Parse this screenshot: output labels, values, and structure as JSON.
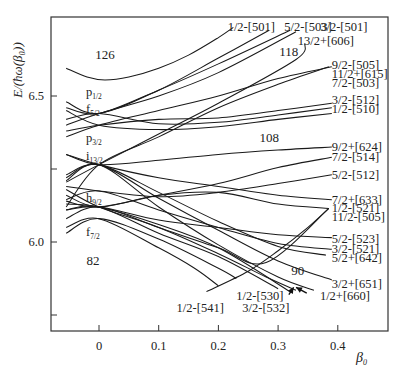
{
  "chart_data": {
    "type": "line",
    "title": "",
    "xlabel": "β₀",
    "ylabel": "E/(ħω(β₀))",
    "xlim": [
      -0.08,
      0.485
    ],
    "ylim": [
      5.7,
      6.775
    ],
    "x_ticks": [
      {
        "value": 0,
        "label": "0"
      },
      {
        "value": 0.1,
        "label": "0.1"
      },
      {
        "value": 0.2,
        "label": "0.2"
      },
      {
        "value": 0.3,
        "label": "0.3"
      },
      {
        "value": 0.4,
        "label": "0.4"
      }
    ],
    "y_ticks": [
      {
        "value": 5.75,
        "label": ""
      },
      {
        "value": 6.0,
        "label": "6.0"
      },
      {
        "value": 6.25,
        "label": ""
      },
      {
        "value": 6.5,
        "label": "6.5"
      }
    ],
    "grid": false,
    "legend": null,
    "spherical_orbitals": [
      {
        "name": "p",
        "sub": "1/2",
        "label_x": -0.015,
        "label_y": 6.515
      },
      {
        "name": "f",
        "sub": "5/2",
        "label_x": -0.015,
        "label_y": 6.455
      },
      {
        "name": "p",
        "sub": "3/2",
        "label_x": -0.015,
        "label_y": 6.355
      },
      {
        "name": "i",
        "sub": "13/2",
        "label_x": -0.015,
        "label_y": 6.295
      },
      {
        "name": "h",
        "sub": "9/2",
        "label_x": -0.015,
        "label_y": 6.15
      },
      {
        "name": "f",
        "sub": "7/2",
        "label_x": -0.015,
        "label_y": 6.035
      }
    ],
    "magic_numbers": [
      {
        "label": "126",
        "x": 0.01,
        "y": 6.645
      },
      {
        "label": "118",
        "x": 0.318,
        "y": 6.655
      },
      {
        "label": "108",
        "x": 0.285,
        "y": 6.36
      },
      {
        "label": "90",
        "x": 0.333,
        "y": 5.905
      },
      {
        "label": "82",
        "x": -0.01,
        "y": 5.94
      }
    ],
    "series": [
      {
        "name": "126-gap curve",
        "points": [
          [
            -0.055,
            6.595
          ],
          [
            -0.02,
            6.565
          ],
          [
            0.01,
            6.555
          ],
          [
            0.05,
            6.565
          ],
          [
            0.1,
            6.595
          ],
          [
            0.15,
            6.64
          ],
          [
            0.2,
            6.7
          ],
          [
            0.225,
            6.735
          ]
        ]
      },
      {
        "name": "1/2-[501]",
        "label_at": [
          0.255,
          6.735
        ],
        "label_anchor": "middle",
        "points": [
          [
            -0.055,
            6.48
          ],
          [
            0.0,
            6.44
          ],
          [
            0.1,
            6.52
          ],
          [
            0.2,
            6.63
          ],
          [
            0.285,
            6.725
          ]
        ]
      },
      {
        "name": "5/2-[503]",
        "label_at": [
          0.35,
          6.735
        ],
        "label_anchor": "middle",
        "points": [
          [
            -0.055,
            6.46
          ],
          [
            0.0,
            6.44
          ],
          [
            0.1,
            6.52
          ],
          [
            0.2,
            6.61
          ],
          [
            0.32,
            6.725
          ]
        ]
      },
      {
        "name": "3/2-[501]",
        "label_at": [
          0.41,
          6.735
        ],
        "label_anchor": "middle",
        "points": [
          [
            -0.055,
            6.4
          ],
          [
            0.0,
            6.44
          ],
          [
            0.1,
            6.5
          ],
          [
            0.2,
            6.58
          ],
          [
            0.33,
            6.72
          ]
        ]
      },
      {
        "name": "13/2+[606]",
        "label_at": [
          0.38,
          6.69
        ],
        "label_anchor": "middle",
        "points": [
          [
            -0.055,
            6.205
          ],
          [
            0.0,
            6.265
          ],
          [
            0.1,
            6.37
          ],
          [
            0.2,
            6.475
          ],
          [
            0.33,
            6.625
          ],
          [
            0.345,
            6.68
          ]
        ]
      },
      {
        "name": "9/2-[505]",
        "label_at": [
          0.39,
          6.605
        ],
        "label_anchor": "start",
        "points": [
          [
            -0.055,
            6.45
          ],
          [
            0.0,
            6.4
          ],
          [
            0.1,
            6.385
          ],
          [
            0.2,
            6.395
          ],
          [
            0.3,
            6.42
          ],
          [
            0.39,
            6.44
          ]
        ]
      },
      {
        "name": "11/2+[615]",
        "label_at": [
          0.39,
          6.575
        ],
        "label_anchor": "start",
        "points": [
          [
            -0.055,
            6.12
          ],
          [
            0.0,
            6.265
          ],
          [
            0.1,
            6.36
          ],
          [
            0.2,
            6.46
          ],
          [
            0.3,
            6.54
          ],
          [
            0.385,
            6.6
          ]
        ]
      },
      {
        "name": "7/2-[503]",
        "label_at": [
          0.39,
          6.545
        ],
        "label_anchor": "start",
        "points": [
          [
            -0.055,
            6.36
          ],
          [
            0.0,
            6.4
          ],
          [
            0.1,
            6.45
          ],
          [
            0.2,
            6.5
          ],
          [
            0.3,
            6.56
          ],
          [
            0.39,
            6.6
          ]
        ]
      },
      {
        "name": "3/2-[512]",
        "label_at": [
          0.39,
          6.488
        ],
        "label_anchor": "start",
        "points": [
          [
            -0.055,
            6.38
          ],
          [
            0.0,
            6.4
          ],
          [
            0.1,
            6.42
          ],
          [
            0.2,
            6.425
          ],
          [
            0.3,
            6.45
          ],
          [
            0.39,
            6.475
          ]
        ]
      },
      {
        "name": "1/2-[510]",
        "label_at": [
          0.39,
          6.455
        ],
        "label_anchor": "start",
        "points": [
          [
            -0.055,
            6.42
          ],
          [
            0.0,
            6.44
          ],
          [
            0.1,
            6.405
          ],
          [
            0.2,
            6.41
          ],
          [
            0.3,
            6.435
          ],
          [
            0.39,
            6.46
          ]
        ]
      },
      {
        "name": "9/2+[624]",
        "label_at": [
          0.39,
          6.325
        ],
        "label_anchor": "start",
        "points": [
          [
            -0.055,
            6.3
          ],
          [
            0.0,
            6.265
          ],
          [
            0.1,
            6.28
          ],
          [
            0.2,
            6.3
          ],
          [
            0.3,
            6.315
          ],
          [
            0.39,
            6.325
          ]
        ]
      },
      {
        "name": "7/2-[514]",
        "label_at": [
          0.39,
          6.29
        ],
        "label_anchor": "start",
        "points": [
          [
            -0.055,
            6.14
          ],
          [
            0.0,
            6.12
          ],
          [
            0.1,
            6.16
          ],
          [
            0.2,
            6.2
          ],
          [
            0.3,
            6.255
          ],
          [
            0.39,
            6.29
          ]
        ]
      },
      {
        "name": "5/2-[512]",
        "label_at": [
          0.39,
          6.23
        ],
        "label_anchor": "start",
        "points": [
          [
            -0.055,
            6.19
          ],
          [
            0.0,
            6.175
          ],
          [
            0.1,
            6.155
          ],
          [
            0.2,
            6.17
          ],
          [
            0.3,
            6.2
          ],
          [
            0.39,
            6.23
          ]
        ]
      },
      {
        "name": "7/2+[633]",
        "label_at": [
          0.39,
          6.145
        ],
        "label_anchor": "start",
        "points": [
          [
            -0.055,
            6.3
          ],
          [
            0.0,
            6.265
          ],
          [
            0.1,
            6.22
          ],
          [
            0.2,
            6.19
          ],
          [
            0.3,
            6.16
          ],
          [
            0.39,
            6.145
          ]
        ]
      },
      {
        "name": "1/2-[521]",
        "label_at": [
          0.39,
          6.115
        ],
        "label_anchor": "start",
        "points": [
          [
            -0.055,
            6.16
          ],
          [
            0.0,
            6.12
          ],
          [
            0.1,
            6.16
          ],
          [
            0.2,
            6.17
          ],
          [
            0.3,
            6.13
          ],
          [
            0.385,
            6.115
          ]
        ]
      },
      {
        "name": "11/2-[505]",
        "label_at": [
          0.39,
          6.087
        ],
        "label_anchor": "start",
        "points": [
          [
            -0.055,
            6.08
          ],
          [
            0.0,
            6.12
          ],
          [
            0.1,
            6.05
          ],
          [
            0.2,
            5.98
          ],
          [
            0.28,
            5.93
          ],
          [
            0.385,
            6.115
          ]
        ]
      },
      {
        "name": "5/2-[523]",
        "label_at": [
          0.39,
          6.01
        ],
        "label_anchor": "start",
        "points": [
          [
            -0.055,
            6.11
          ],
          [
            0.0,
            6.12
          ],
          [
            0.1,
            6.075
          ],
          [
            0.2,
            6.05
          ],
          [
            0.3,
            6.025
          ],
          [
            0.39,
            6.015
          ]
        ]
      },
      {
        "name": "3/2-[521]",
        "label_at": [
          0.39,
          5.975
        ],
        "label_anchor": "start",
        "points": [
          [
            -0.055,
            6.145
          ],
          [
            0.0,
            6.175
          ],
          [
            0.1,
            6.11
          ],
          [
            0.2,
            6.05
          ],
          [
            0.3,
            5.995
          ],
          [
            0.39,
            5.975
          ]
        ]
      },
      {
        "name": "5/2+[642]",
        "label_at": [
          0.39,
          5.945
        ],
        "label_anchor": "start",
        "points": [
          [
            -0.055,
            6.23
          ],
          [
            0.0,
            6.265
          ],
          [
            0.1,
            6.17
          ],
          [
            0.2,
            6.07
          ],
          [
            0.3,
            5.985
          ],
          [
            0.38,
            5.955
          ]
        ]
      },
      {
        "name": "3/2+[651]",
        "label_at": [
          0.39,
          5.855
        ],
        "label_anchor": "start",
        "points": [
          [
            -0.055,
            6.22
          ],
          [
            0.0,
            6.265
          ],
          [
            0.1,
            6.15
          ],
          [
            0.2,
            6.04
          ],
          [
            0.3,
            5.935
          ],
          [
            0.39,
            5.87
          ]
        ]
      },
      {
        "name": "1/2+[660]",
        "label_at": [
          0.37,
          5.815
        ],
        "label_anchor": "start",
        "points": [
          [
            -0.055,
            6.21
          ],
          [
            0.0,
            6.265
          ],
          [
            0.1,
            6.12
          ],
          [
            0.2,
            5.99
          ],
          [
            0.3,
            5.88
          ],
          [
            0.36,
            5.835
          ]
        ]
      },
      {
        "name": "1/2-[530]",
        "label_at": [
          0.23,
          5.815
        ],
        "label_anchor": "start",
        "points": [
          [
            -0.055,
            6.11
          ],
          [
            0.0,
            6.12
          ],
          [
            0.1,
            6.03
          ],
          [
            0.2,
            5.95
          ],
          [
            0.3,
            5.84
          ]
        ]
      },
      {
        "name": "3/2-[532]",
        "label_at": [
          0.24,
          5.775
        ],
        "label_anchor": "start",
        "points": [
          [
            -0.055,
            6.13
          ],
          [
            0.0,
            6.12
          ],
          [
            0.1,
            6.06
          ],
          [
            0.2,
            5.98
          ],
          [
            0.32,
            5.83
          ]
        ]
      },
      {
        "name": "1/2-[541]",
        "label_at": [
          0.13,
          5.775
        ],
        "label_anchor": "start",
        "points": [
          [
            -0.055,
            6.03
          ],
          [
            0.0,
            6.08
          ],
          [
            0.1,
            6.01
          ],
          [
            0.2,
            5.91
          ],
          [
            0.23,
            5.875
          ]
        ]
      },
      {
        "name": "f7/2 lower",
        "points": [
          [
            -0.055,
            6.05
          ],
          [
            0.0,
            6.08
          ],
          [
            0.1,
            5.98
          ],
          [
            0.16,
            5.91
          ],
          [
            0.2,
            5.85
          ]
        ]
      },
      {
        "name": "h9/2 low",
        "points": [
          [
            -0.055,
            6.18
          ],
          [
            0.0,
            6.12
          ],
          [
            0.1,
            6.05
          ],
          [
            0.2,
            5.96
          ],
          [
            0.28,
            5.88
          ],
          [
            0.33,
            5.835
          ]
        ]
      },
      {
        "name": "rising 9/2-[505] path",
        "points": [
          [
            0.18,
            5.83
          ],
          [
            0.25,
            5.9
          ],
          [
            0.3,
            5.97
          ],
          [
            0.35,
            6.05
          ],
          [
            0.385,
            6.115
          ]
        ]
      }
    ],
    "arrows": [
      {
        "from": [
          0.318,
          5.82
        ],
        "to": [
          0.326,
          5.845
        ]
      },
      {
        "from": [
          0.348,
          5.825
        ],
        "to": [
          0.33,
          5.845
        ]
      }
    ]
  },
  "axes": {
    "x_label": "β",
    "x_label_sub": "0",
    "y_label": "E/(ħω(β₀))"
  },
  "magic": {
    "m126": "126",
    "m118": "118",
    "m108": "108",
    "m90": "90",
    "m82": "82"
  }
}
